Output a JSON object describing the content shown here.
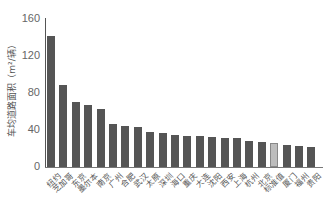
{
  "chart_data": {
    "type": "bar",
    "title": "",
    "xlabel": "",
    "ylabel": "车均道路面积（m²/辆）",
    "ylim": [
      0,
      160
    ],
    "yticks": [
      0,
      40,
      80,
      120,
      160
    ],
    "grid": false,
    "legend": null,
    "categories": [
      "纽约",
      "芝加哥",
      "东京",
      "墨尔本",
      "南京",
      "广州",
      "合肥",
      "武汉",
      "太原",
      "深圳",
      "海口",
      "重庆",
      "大连",
      "沈阳",
      "西安",
      "上海",
      "杭州",
      "北京",
      "标准值",
      "厦门",
      "福州",
      "贵阳"
    ],
    "values": [
      142,
      89,
      70,
      67,
      63,
      46,
      44,
      43,
      38,
      37,
      35,
      34,
      33,
      32,
      31,
      31,
      28,
      27,
      26,
      24,
      23,
      22
    ],
    "highlight_index": 18,
    "colors": {
      "bar": "#555555",
      "highlight": "#bdbdbd"
    }
  }
}
